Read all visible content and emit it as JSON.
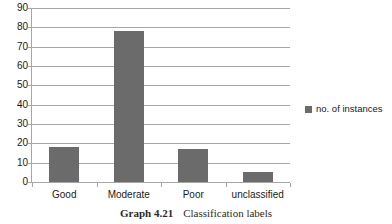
{
  "chart_data": {
    "type": "bar",
    "title": "",
    "subtitle": "",
    "xlabel": "",
    "ylabel": "",
    "categories": [
      "Good",
      "Moderate",
      "Poor",
      "unclassified"
    ],
    "series": [
      {
        "name": "no. of instances",
        "values": [
          18,
          78,
          17,
          5
        ],
        "color": "#6b6b6b"
      }
    ],
    "ylim": [
      0,
      90
    ],
    "ytick_step": 10,
    "ytick_labels": [
      "90",
      "80",
      "70",
      "60",
      "50",
      "40",
      "30",
      "20",
      "10",
      "0"
    ],
    "ytick_values": [
      90,
      80,
      70,
      60,
      50,
      40,
      30,
      20,
      10,
      0
    ],
    "grid": true,
    "grid_axis": "y",
    "grid_color": "#a6a6a6",
    "legend_position": "right",
    "legend_entries": [
      "no. of instances"
    ],
    "background": "#ffffff",
    "text_color": "#1a1a1a"
  },
  "legend": {
    "label": "no. of instances"
  },
  "caption": {
    "number": "Graph 4.21",
    "text": "Classification labels"
  }
}
